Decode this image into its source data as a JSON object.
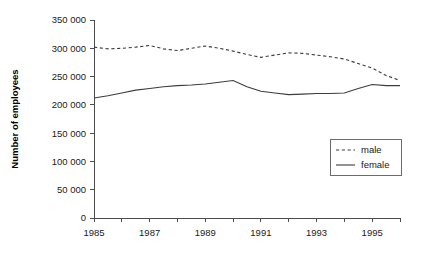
{
  "chart_data": {
    "type": "line",
    "title": "",
    "subtitle": "",
    "xlabel": "",
    "ylabel": "Number of employees",
    "xlim": [
      1985,
      1996
    ],
    "ylim": [
      0,
      350000
    ],
    "grid": false,
    "legend_position": "bottom-right",
    "y_ticks": [
      0,
      50000,
      100000,
      150000,
      200000,
      250000,
      300000,
      350000
    ],
    "y_tick_labels": [
      "0",
      "50 000",
      "100 000",
      "150 000",
      "200 000",
      "250 000",
      "300 000",
      "350 000"
    ],
    "x_ticks": [
      1985,
      1986,
      1987,
      1988,
      1989,
      1990,
      1991,
      1992,
      1993,
      1994,
      1995,
      1996
    ],
    "x_tick_labels": [
      "1985",
      "",
      "1987",
      "",
      "1989",
      "",
      "1991",
      "",
      "1993",
      "",
      "1995",
      ""
    ],
    "x": [
      1985,
      1985.5,
      1986,
      1986.5,
      1987,
      1987.5,
      1988,
      1988.5,
      1989,
      1989.5,
      1990,
      1990.5,
      1991,
      1991.5,
      1992,
      1992.5,
      1993,
      1993.5,
      1994,
      1994.5,
      1995,
      1995.5,
      1996
    ],
    "series": [
      {
        "name": "male",
        "style": "dashed",
        "color": "#3c3c3c",
        "values": [
          302000,
          299000,
          300000,
          302000,
          305000,
          299000,
          296000,
          300000,
          304000,
          300000,
          295000,
          289000,
          284000,
          288000,
          292000,
          291000,
          288000,
          285000,
          281000,
          273000,
          265000,
          252000,
          243000
        ]
      },
      {
        "name": "female",
        "style": "solid",
        "color": "#3c3c3c",
        "values": [
          212000,
          216000,
          221000,
          226000,
          229000,
          232000,
          234000,
          235000,
          237000,
          240000,
          243000,
          232000,
          224000,
          221000,
          218000,
          219000,
          220000,
          220000,
          221000,
          229000,
          236000,
          234000,
          234000
        ]
      }
    ],
    "legend": [
      {
        "label": "male",
        "style": "dashed"
      },
      {
        "label": "female",
        "style": "solid"
      }
    ]
  },
  "geometry": {
    "plot_left": 94,
    "plot_right": 400,
    "plot_top": 20,
    "plot_bottom": 218,
    "legend_x": 330,
    "legend_y": 139,
    "legend_w": 71,
    "legend_h": 36
  }
}
